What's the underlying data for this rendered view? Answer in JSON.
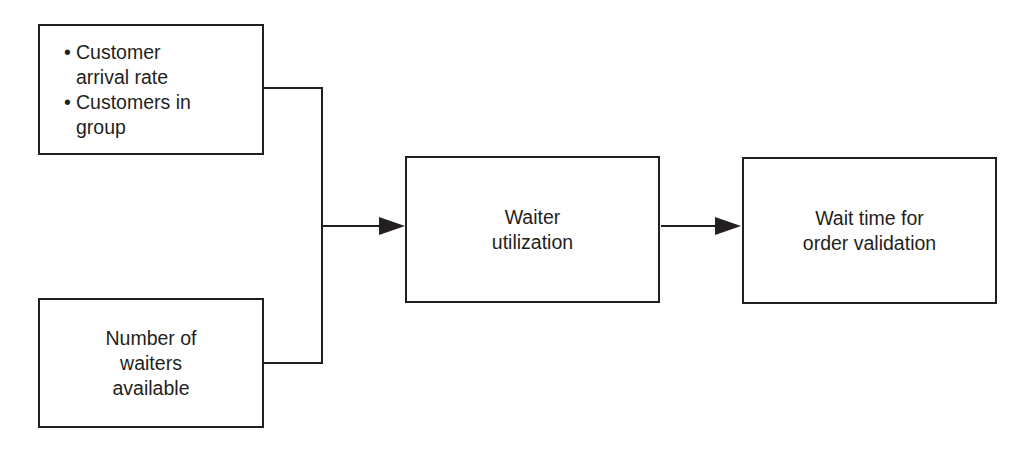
{
  "diagram": {
    "inputs": {
      "customer_box": {
        "items": [
          {
            "bullet": "•",
            "lines": [
              "Customer",
              "arrival rate"
            ]
          },
          {
            "bullet": "•",
            "lines": [
              "Customers in",
              "group"
            ]
          }
        ]
      },
      "waiters_box": {
        "lines": [
          "Number of",
          "waiters",
          "available"
        ]
      }
    },
    "middle_box": {
      "lines": [
        "Waiter",
        "utilization"
      ]
    },
    "output_box": {
      "lines": [
        "Wait time for",
        "order validation"
      ]
    },
    "colors": {
      "line": "#231f20",
      "background": "#ffffff"
    }
  }
}
